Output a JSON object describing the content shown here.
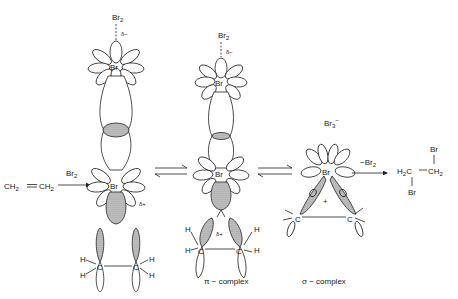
{
  "diagram": {
    "reactant": {
      "left": "CH",
      "left_sub": "2",
      "bond": "=",
      "right": "CH",
      "right_sub": "2"
    },
    "arrow1_label": {
      "text": "Br",
      "sub": "2"
    },
    "stage1": {
      "top_reagent": {
        "text": "Br",
        "sub": "2"
      },
      "delta_minus": "δ−",
      "top_atom": "Br",
      "bottom_atom": "Br",
      "delta_plus": "δ+",
      "carbons": [
        "C",
        "C"
      ],
      "hydrogens": [
        "H",
        "H",
        "H",
        "H"
      ]
    },
    "stage2": {
      "top_reagent": {
        "text": "Br",
        "sub": "2"
      },
      "delta_minus": "δ−",
      "top_atom": "Br",
      "bottom_atom": "Br",
      "delta_plus": "δ+",
      "carbons": [
        "C",
        "C"
      ],
      "hydrogens": [
        "H",
        "H",
        "H",
        "H"
      ],
      "caption": "π − complex"
    },
    "stage3": {
      "counter_ion": {
        "text": "Br",
        "sub": "3",
        "sup": "−"
      },
      "atom": "Br",
      "charge": "+",
      "carbons": [
        "C",
        "C"
      ],
      "caption": "σ − complex"
    },
    "arrow_final_label": {
      "text": "−Br",
      "sub": "2"
    },
    "product": {
      "top_br": "Br",
      "left": "H",
      "left_sub": "2",
      "left_c": "C",
      "bond": "—",
      "right": "CH",
      "right_sub": "2",
      "bottom_br": "Br"
    }
  }
}
